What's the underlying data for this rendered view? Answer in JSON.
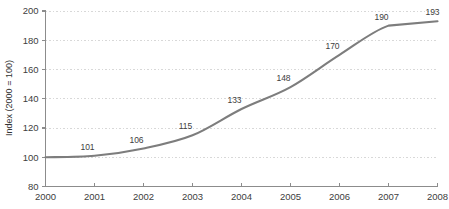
{
  "chart_data": {
    "type": "line",
    "title": "",
    "xlabel": "",
    "ylabel": "Index (2000 = 100)",
    "categories": [
      "2000",
      "2001",
      "2002",
      "2003",
      "2004",
      "2005",
      "2006",
      "2007",
      "2008"
    ],
    "x": [
      2000,
      2001,
      2002,
      2003,
      2004,
      2005,
      2006,
      2007,
      2008
    ],
    "values": [
      100,
      101,
      106,
      115,
      133,
      148,
      170,
      190,
      193
    ],
    "point_labels": [
      "",
      "101",
      "106",
      "115",
      "133",
      "148",
      "170",
      "190",
      "193"
    ],
    "ylim": [
      80,
      200
    ],
    "xlim": [
      2000,
      2008
    ],
    "yticks": [
      80,
      100,
      120,
      140,
      160,
      180,
      200
    ],
    "ytick_labels": [
      "80",
      "100",
      "120",
      "140",
      "160",
      "180",
      "200"
    ],
    "xticks": [
      2000,
      2001,
      2002,
      2003,
      2004,
      2005,
      2006,
      2007,
      2008
    ],
    "xtick_labels": [
      "2000",
      "2001",
      "2002",
      "2003",
      "2004",
      "2005",
      "2006",
      "2007",
      "2008"
    ],
    "grid": true,
    "grid_axis": "y",
    "legend": false,
    "legend_position": "none",
    "series": [
      {
        "name": "Index",
        "values": [
          100,
          101,
          106,
          115,
          133,
          148,
          170,
          190,
          193
        ],
        "color": "#7d7d7d"
      }
    ],
    "colors": {
      "line": "#7d7d7d",
      "axis": "#8c8c8c",
      "grid": "#d8d8d8",
      "text": "#404040",
      "background": "#ffffff"
    }
  }
}
